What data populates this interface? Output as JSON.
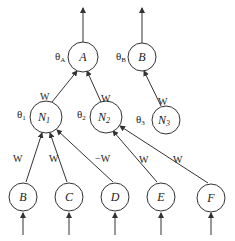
{
  "diagram": {
    "title": "",
    "nodes": {
      "A": {
        "label": "A",
        "theta": "θ",
        "theta_sub": "A"
      },
      "Btop": {
        "label": "B",
        "theta": "θ",
        "theta_sub": "B"
      },
      "N1": {
        "label": "N",
        "sub": "1",
        "theta": "θ",
        "theta_sub": "1"
      },
      "N2": {
        "label": "N",
        "sub": "2",
        "theta": "θ",
        "theta_sub": "2"
      },
      "N3": {
        "label": "N",
        "sub": "3",
        "theta": "θ",
        "theta_sub": "3"
      },
      "B": {
        "label": "B"
      },
      "C": {
        "label": "C"
      },
      "D": {
        "label": "D"
      },
      "E": {
        "label": "E"
      },
      "F": {
        "label": "F"
      }
    },
    "edges": {
      "N1_A": "W",
      "N2_A": "W",
      "N3_Btop": "W",
      "B_N1": "W",
      "C_N1": "W",
      "D_N1": "−W",
      "E_N2": "W",
      "F_N2": "W"
    }
  }
}
